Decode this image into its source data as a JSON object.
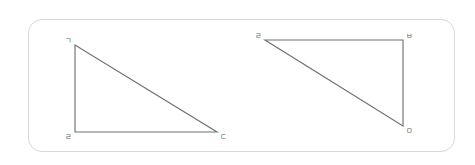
{
  "figure": {
    "panel": {
      "name": "figure-panel",
      "border_color": "#d6d8d9",
      "background_color": "#ffffff",
      "corner_radius": 14
    },
    "stroke_color": "#6f7276",
    "label_color": "#585b5f",
    "shapes": [
      {
        "id": "left-triangle",
        "type": "right-triangle",
        "right_angle_at": "bottom-left",
        "vertices": [
          {
            "label": "ㄱ",
            "x": 75,
            "y": 45,
            "position": "top-left"
          },
          {
            "label": "ㄹ",
            "x": 75,
            "y": 132,
            "position": "bottom-left"
          },
          {
            "label": "ㄷ",
            "x": 217,
            "y": 132,
            "position": "bottom-right"
          }
        ],
        "edges": [
          {
            "from": 0,
            "to": 1,
            "role": "vertical-leg"
          },
          {
            "from": 1,
            "to": 2,
            "role": "horizontal-leg"
          },
          {
            "from": 0,
            "to": 2,
            "role": "hypotenuse"
          }
        ]
      },
      {
        "id": "right-triangle",
        "type": "right-triangle",
        "right_angle_at": "top-right",
        "vertices": [
          {
            "label": "ㄹ",
            "x": 265,
            "y": 40,
            "position": "top-left"
          },
          {
            "label": "ㅂ",
            "x": 403,
            "y": 40,
            "position": "top-right"
          },
          {
            "label": "ㅁ",
            "x": 403,
            "y": 126,
            "position": "bottom-right"
          }
        ],
        "edges": [
          {
            "from": 0,
            "to": 1,
            "role": "horizontal-leg"
          },
          {
            "from": 1,
            "to": 2,
            "role": "vertical-leg"
          },
          {
            "from": 0,
            "to": 2,
            "role": "hypotenuse"
          }
        ]
      }
    ]
  }
}
